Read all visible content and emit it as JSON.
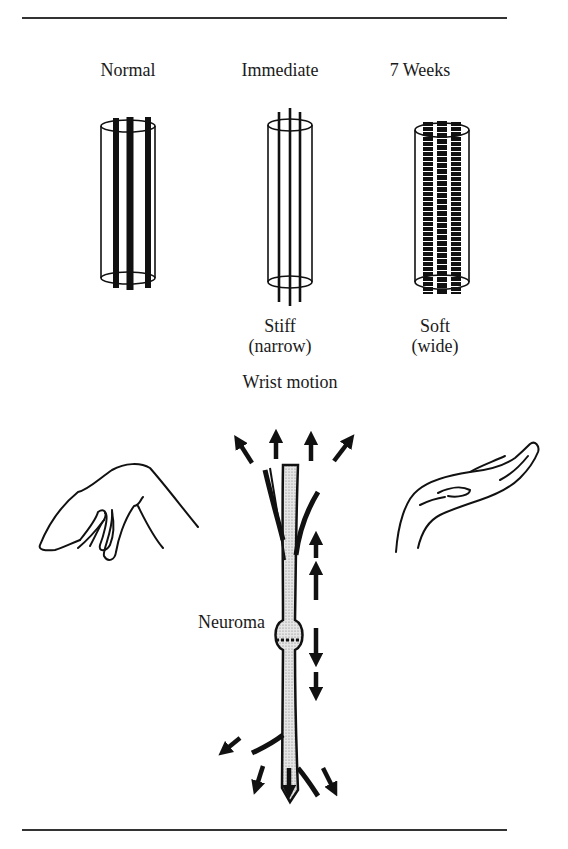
{
  "figure": {
    "columns": [
      {
        "title": "Normal",
        "caption_line1": "",
        "caption_line2": ""
      },
      {
        "title": "Immediate",
        "caption_line1": "Stiff",
        "caption_line2": "(narrow)"
      },
      {
        "title": "7 Weeks",
        "caption_line1": "Soft",
        "caption_line2": "(wide)"
      }
    ],
    "motion_label": "Wrist motion",
    "neuroma_label": "Neuroma"
  }
}
